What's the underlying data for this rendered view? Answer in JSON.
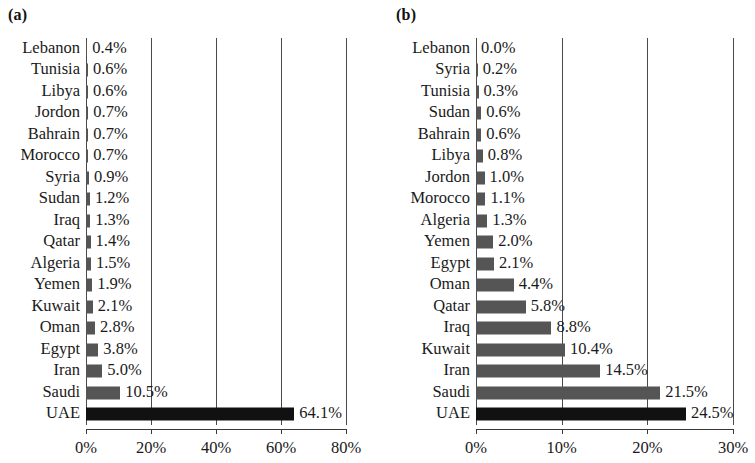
{
  "figure": {
    "panels": [
      {
        "caption": "(a)",
        "axis": {
          "ticks": [
            "0%",
            "20%",
            "40%",
            "60%",
            "80%"
          ],
          "tick_values": [
            0,
            20,
            40,
            60,
            80
          ],
          "xmin": 0,
          "xmax": 80
        },
        "rows": [
          {
            "label": "Lebanon",
            "value": 0.4,
            "value_label": "0.4%"
          },
          {
            "label": "Tunisia",
            "value": 0.6,
            "value_label": "0.6%"
          },
          {
            "label": "Libya",
            "value": 0.6,
            "value_label": "0.6%"
          },
          {
            "label": "Jordon",
            "value": 0.7,
            "value_label": "0.7%"
          },
          {
            "label": "Bahrain",
            "value": 0.7,
            "value_label": "0.7%"
          },
          {
            "label": "Morocco",
            "value": 0.7,
            "value_label": "0.7%"
          },
          {
            "label": "Syria",
            "value": 0.9,
            "value_label": "0.9%"
          },
          {
            "label": "Sudan",
            "value": 1.2,
            "value_label": "1.2%"
          },
          {
            "label": "Iraq",
            "value": 1.3,
            "value_label": "1.3%"
          },
          {
            "label": "Qatar",
            "value": 1.4,
            "value_label": "1.4%"
          },
          {
            "label": "Algeria",
            "value": 1.5,
            "value_label": "1.5%"
          },
          {
            "label": "Yemen",
            "value": 1.9,
            "value_label": "1.9%"
          },
          {
            "label": "Kuwait",
            "value": 2.1,
            "value_label": "2.1%"
          },
          {
            "label": "Oman",
            "value": 2.8,
            "value_label": "2.8%"
          },
          {
            "label": "Egypt",
            "value": 3.8,
            "value_label": "3.8%"
          },
          {
            "label": "Iran",
            "value": 5.0,
            "value_label": "5.0%"
          },
          {
            "label": "Saudi",
            "value": 10.5,
            "value_label": "10.5%"
          },
          {
            "label": "UAE",
            "value": 64.1,
            "value_label": "64.1%",
            "highlight": true
          }
        ]
      },
      {
        "caption": "(b)",
        "axis": {
          "ticks": [
            "0%",
            "10%",
            "20%",
            "30%"
          ],
          "tick_values": [
            0,
            10,
            20,
            30
          ],
          "xmin": 0,
          "xmax": 30
        },
        "rows": [
          {
            "label": "Lebanon",
            "value": 0.0,
            "value_label": "0.0%"
          },
          {
            "label": "Syria",
            "value": 0.2,
            "value_label": "0.2%"
          },
          {
            "label": "Tunisia",
            "value": 0.3,
            "value_label": "0.3%"
          },
          {
            "label": "Sudan",
            "value": 0.6,
            "value_label": "0.6%"
          },
          {
            "label": "Bahrain",
            "value": 0.6,
            "value_label": "0.6%"
          },
          {
            "label": "Libya",
            "value": 0.8,
            "value_label": "0.8%"
          },
          {
            "label": "Jordon",
            "value": 1.0,
            "value_label": "1.0%"
          },
          {
            "label": "Morocco",
            "value": 1.1,
            "value_label": "1.1%"
          },
          {
            "label": "Algeria",
            "value": 1.3,
            "value_label": "1.3%"
          },
          {
            "label": "Yemen",
            "value": 2.0,
            "value_label": "2.0%"
          },
          {
            "label": "Egypt",
            "value": 2.1,
            "value_label": "2.1%"
          },
          {
            "label": "Oman",
            "value": 4.4,
            "value_label": "4.4%"
          },
          {
            "label": "Qatar",
            "value": 5.8,
            "value_label": "5.8%"
          },
          {
            "label": "Iraq",
            "value": 8.8,
            "value_label": "8.8%"
          },
          {
            "label": "Kuwait",
            "value": 10.4,
            "value_label": "10.4%"
          },
          {
            "label": "Iran",
            "value": 14.5,
            "value_label": "14.5%"
          },
          {
            "label": "Saudi",
            "value": 21.5,
            "value_label": "21.5%"
          },
          {
            "label": "UAE",
            "value": 24.5,
            "value_label": "24.5%",
            "highlight": true
          }
        ]
      }
    ],
    "colors": {
      "bar": "#555555",
      "bar_highlight": "#111111",
      "gridline": "#4a4a4a",
      "text": "#1a1a1a",
      "background": "#ffffff"
    }
  },
  "chart_data": [
    {
      "type": "bar",
      "orientation": "horizontal",
      "title": "(a)",
      "xlabel": "",
      "ylabel": "",
      "xlim": [
        0,
        80
      ],
      "xticks": [
        0,
        20,
        40,
        60,
        80
      ],
      "xtick_labels": [
        "0%",
        "20%",
        "40%",
        "60%",
        "80%"
      ],
      "grid": true,
      "legend": "none",
      "categories": [
        "Lebanon",
        "Tunisia",
        "Libya",
        "Jordon",
        "Bahrain",
        "Morocco",
        "Syria",
        "Sudan",
        "Iraq",
        "Qatar",
        "Algeria",
        "Yemen",
        "Kuwait",
        "Oman",
        "Egypt",
        "Iran",
        "Saudi",
        "UAE"
      ],
      "values": [
        0.4,
        0.6,
        0.6,
        0.7,
        0.7,
        0.7,
        0.9,
        1.2,
        1.3,
        1.4,
        1.5,
        1.9,
        2.1,
        2.8,
        3.8,
        5.0,
        10.5,
        64.1
      ],
      "data_labels": [
        "0.4%",
        "0.6%",
        "0.6%",
        "0.7%",
        "0.7%",
        "0.7%",
        "0.9%",
        "1.2%",
        "1.3%",
        "1.4%",
        "1.5%",
        "1.9%",
        "2.1%",
        "2.8%",
        "3.8%",
        "5.0%",
        "10.5%",
        "64.1%"
      ]
    },
    {
      "type": "bar",
      "orientation": "horizontal",
      "title": "(b)",
      "xlabel": "",
      "ylabel": "",
      "xlim": [
        0,
        30
      ],
      "xticks": [
        0,
        10,
        20,
        30
      ],
      "xtick_labels": [
        "0%",
        "10%",
        "20%",
        "30%"
      ],
      "grid": true,
      "legend": "none",
      "categories": [
        "Lebanon",
        "Syria",
        "Tunisia",
        "Sudan",
        "Bahrain",
        "Libya",
        "Jordon",
        "Morocco",
        "Algeria",
        "Yemen",
        "Egypt",
        "Oman",
        "Qatar",
        "Iraq",
        "Kuwait",
        "Iran",
        "Saudi",
        "UAE"
      ],
      "values": [
        0.0,
        0.2,
        0.3,
        0.6,
        0.6,
        0.8,
        1.0,
        1.1,
        1.3,
        2.0,
        2.1,
        4.4,
        5.8,
        8.8,
        10.4,
        14.5,
        21.5,
        24.5
      ],
      "data_labels": [
        "0.0%",
        "0.2%",
        "0.3%",
        "0.6%",
        "0.6%",
        "0.8%",
        "1.0%",
        "1.1%",
        "1.3%",
        "2.0%",
        "2.1%",
        "4.4%",
        "5.8%",
        "8.8%",
        "10.4%",
        "14.5%",
        "21.5%",
        "24.5%"
      ]
    }
  ]
}
